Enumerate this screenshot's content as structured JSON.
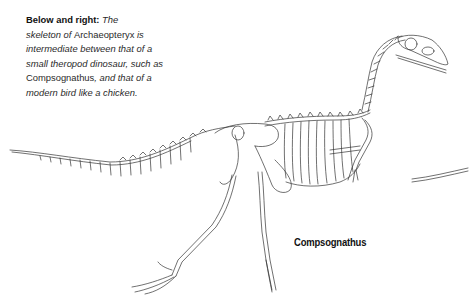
{
  "caption": {
    "lead": "Below and right:",
    "segments": [
      {
        "text": " The skeleton of ",
        "style": "italic"
      },
      {
        "text": "Archaeopteryx",
        "style": "plain"
      },
      {
        "text": " is intermediate between that of a small theropod dinosaur, such as ",
        "style": "italic"
      },
      {
        "text": "Compsognathus",
        "style": "plain"
      },
      {
        "text": ", and that of a modern bird like a chicken.",
        "style": "italic"
      }
    ],
    "s0": " The",
    "s1": "skeleton of ",
    "s2": "Archaeopteryx",
    "s3": "is intermediate between that of a small theropod dinosaur, such as",
    "s4": "Compsognathus",
    "s5": ", and that of a modern bird like a chicken."
  },
  "figure": {
    "label": "Compsognathus",
    "line_color": "#333333",
    "background": "#ffffff"
  }
}
